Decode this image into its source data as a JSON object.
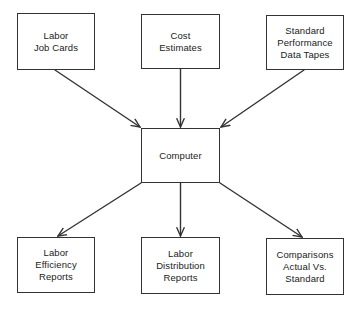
{
  "diagram": {
    "type": "flowchart",
    "colors": {
      "stroke": "#333333",
      "text": "#222222",
      "background": "#ffffff"
    },
    "inputs": [
      {
        "id": "labor-job-cards",
        "label": "Labor\nJob Cards"
      },
      {
        "id": "cost-estimates",
        "label": "Cost\nEstimates"
      },
      {
        "id": "standard-performance-data-tapes",
        "label": "Standard\nPerformance\nData Tapes"
      }
    ],
    "center": {
      "id": "computer",
      "label": "Computer"
    },
    "outputs": [
      {
        "id": "labor-efficiency-reports",
        "label": "Labor\nEfficiency\nReports"
      },
      {
        "id": "labor-distribution-reports",
        "label": "Labor\nDistribution\nReports"
      },
      {
        "id": "comparisons-actual-vs-standard",
        "label": "Comparisons\nActual Vs.\nStandard"
      }
    ],
    "edges": [
      {
        "from": "labor-job-cards",
        "to": "computer"
      },
      {
        "from": "cost-estimates",
        "to": "computer"
      },
      {
        "from": "standard-performance-data-tapes",
        "to": "computer"
      },
      {
        "from": "computer",
        "to": "labor-efficiency-reports"
      },
      {
        "from": "computer",
        "to": "labor-distribution-reports"
      },
      {
        "from": "computer",
        "to": "comparisons-actual-vs-standard"
      }
    ]
  }
}
